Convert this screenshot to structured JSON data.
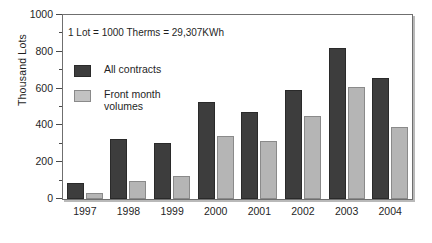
{
  "chart_data": {
    "type": "bar",
    "title": "",
    "subtitle": "",
    "xlabel": "",
    "ylabel": "Thousand Lots",
    "ylim": [
      0,
      1000
    ],
    "ytick_major_step": 200,
    "ytick_minor_step": 100,
    "ytick_labels": [
      "0",
      "200",
      "400",
      "600",
      "800",
      "1000"
    ],
    "ytick_values": [
      0,
      200,
      400,
      600,
      800,
      1000
    ],
    "grid": false,
    "legend_position": "inside-upper-left",
    "categories": [
      "1997",
      "1998",
      "1999",
      "2000",
      "2001",
      "2002",
      "2003",
      "2004"
    ],
    "series": [
      {
        "name": "All contracts",
        "color": "#3d3d3d",
        "values": [
          85,
          325,
          305,
          525,
          475,
          590,
          820,
          660
        ]
      },
      {
        "name": "Front month volumes",
        "color": "#b5b5b5",
        "values": [
          30,
          100,
          125,
          345,
          315,
          450,
          610,
          390
        ]
      }
    ],
    "annotations": [
      {
        "name": "unit-note",
        "text": "1 Lot = 1000 Therms = 29,307KWh"
      }
    ]
  },
  "axis": {
    "y_title": "Thousand Lots"
  },
  "legend": {
    "items": [
      {
        "label": "All contracts",
        "swatch": "dark"
      },
      {
        "label": "Front month\nvolumes",
        "swatch": "light"
      }
    ]
  },
  "colors": {
    "series_dark": "#3d3d3d",
    "series_light": "#b5b5b5",
    "frame": "#6f6f6f",
    "text": "#1f1f1f",
    "background": "#ffffff"
  }
}
